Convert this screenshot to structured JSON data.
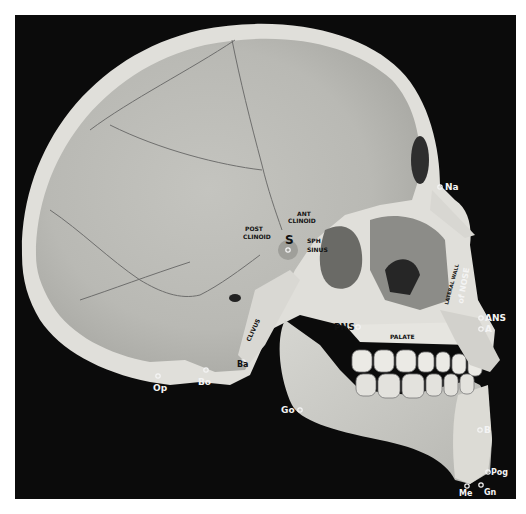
{
  "figure": {
    "background_color": "#0b0b0b",
    "bone_color": "#c9c9c4",
    "bone_rim_color": "#e2e1dc",
    "label_color": "#f4f4f4",
    "landmarks": {
      "na": "Na",
      "ans": "ANS",
      "a": "A",
      "pns": "PNS",
      "s": "S",
      "ba": "Ba",
      "bo": "Bo",
      "op": "Op",
      "go": "Go",
      "b": "B",
      "pog": "Pog",
      "gn": "Gn",
      "me": "Me"
    },
    "structures": {
      "ant_clinoid_1": "ANT",
      "ant_clinoid_2": "CLINOID",
      "post_clinoid_1": "POST",
      "post_clinoid_2": "CLINOID",
      "sph_sinus_1": "SPH",
      "sph_sinus_2": "SINUS",
      "clivus": "CLIVUS",
      "palate": "PALATE",
      "lateral_wall": "LATERAL WALL",
      "of_nose": "of NOSE"
    }
  }
}
